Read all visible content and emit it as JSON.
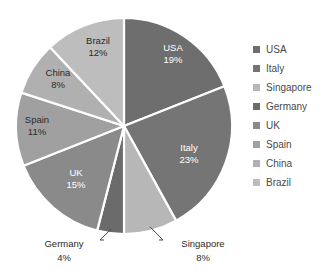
{
  "chart_data": {
    "type": "pie",
    "title": "",
    "subtitle": "",
    "xlabel": "",
    "ylabel": "",
    "grid": false,
    "legend_position": "right",
    "start_angle_deg": 0,
    "direction": "clockwise",
    "units": "percent",
    "categories": [
      "USA",
      "Italy",
      "Singapore",
      "Germany",
      "UK",
      "Spain",
      "China",
      "Brazil"
    ],
    "values": [
      19,
      23,
      8,
      4,
      15,
      11,
      8,
      12
    ],
    "slices": [
      {
        "label": "USA",
        "value": 19,
        "value_text": "19%",
        "color": "#6e6e6e",
        "label_color": "#ffffff",
        "label_placement": "inside",
        "label_x": 173,
        "label_y": 48,
        "pct_x": 173,
        "pct_y": 60
      },
      {
        "label": "Italy",
        "value": 23,
        "value_text": "23%",
        "color": "#757575",
        "label_color": "#ffffff",
        "label_placement": "inside",
        "label_x": 189,
        "label_y": 148,
        "pct_x": 189,
        "pct_y": 160
      },
      {
        "label": "Singapore",
        "value": 8,
        "value_text": "8%",
        "color": "#b7b7b7",
        "label_color": "#2b2b2b",
        "label_placement": "outside",
        "label_x": 203,
        "label_y": 244,
        "pct_x": 203,
        "pct_y": 258
      },
      {
        "label": "Germany",
        "value": 4,
        "value_text": "4%",
        "color": "#6b6b6b",
        "label_color": "#2b2b2b",
        "label_placement": "outside",
        "label_x": 64,
        "label_y": 244,
        "pct_x": 64,
        "pct_y": 258
      },
      {
        "label": "UK",
        "value": 15,
        "value_text": "15%",
        "color": "#8a8a8a",
        "label_color": "#ffffff",
        "label_placement": "inside",
        "label_x": 76,
        "label_y": 173,
        "pct_x": 76,
        "pct_y": 185
      },
      {
        "label": "Spain",
        "value": 11,
        "value_text": "11%",
        "color": "#a0a0a0",
        "label_color": "#2b2b2b",
        "label_placement": "inside",
        "label_x": 37,
        "label_y": 120,
        "pct_x": 37,
        "pct_y": 132
      },
      {
        "label": "China",
        "value": 8,
        "value_text": "8%",
        "color": "#b0b0b0",
        "label_color": "#2b2b2b",
        "label_placement": "inside",
        "label_x": 58,
        "label_y": 73,
        "pct_x": 58,
        "pct_y": 85
      },
      {
        "label": "Brazil",
        "value": 12,
        "value_text": "12%",
        "color": "#bdbdbd",
        "label_color": "#2b2b2b",
        "label_placement": "inside",
        "label_x": 98,
        "label_y": 41,
        "pct_x": 98,
        "pct_y": 53
      }
    ],
    "geometry": {
      "center_x": 124,
      "center_y": 126,
      "radius": 108,
      "separator_color": "#ffffff",
      "separator_width": 2.2
    },
    "background_color": "#ffffff"
  },
  "legend": {
    "items": [
      {
        "label": "USA",
        "color": "#6e6e6e"
      },
      {
        "label": "Italy",
        "color": "#757575"
      },
      {
        "label": "Singapore",
        "color": "#b7b7b7"
      },
      {
        "label": "Germany",
        "color": "#6b6b6b"
      },
      {
        "label": "UK",
        "color": "#8a8a8a"
      },
      {
        "label": "Spain",
        "color": "#a0a0a0"
      },
      {
        "label": "China",
        "color": "#b0b0b0"
      },
      {
        "label": "Brazil",
        "color": "#bdbdbd"
      }
    ]
  }
}
